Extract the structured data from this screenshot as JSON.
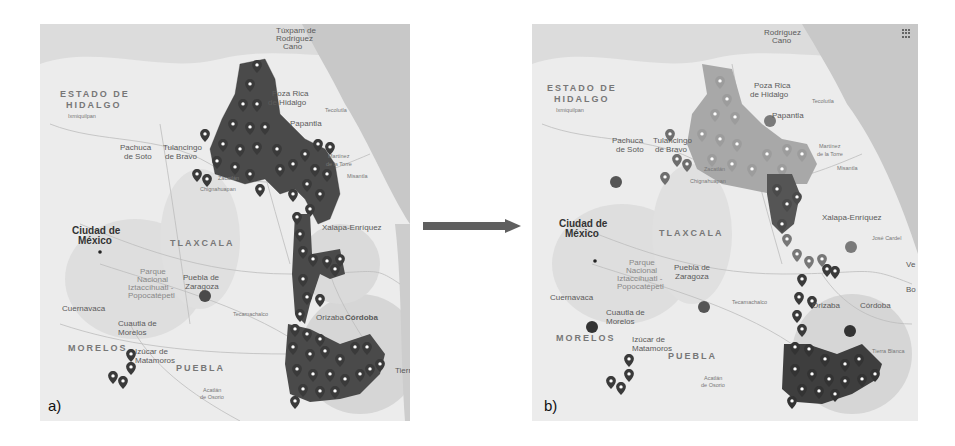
{
  "figure": {
    "panels": [
      {
        "tag": "a)",
        "labels": {
          "state_hidalgo_1": "ESTADO DE",
          "state_hidalgo_2": "HIDALGO",
          "ixmiquilpan": "Ixmiquilpan",
          "tuxpam_1": "Túxpam de",
          "tuxpam_2": "Rodríguez",
          "tuxpam_3": "Cano",
          "poza_rica_1": "Poza Rica",
          "poza_rica_2": "de Hidalgo",
          "tecolutla": "Tecolutla",
          "papantla": "Papantla",
          "martinez_1": "Martínez",
          "martinez_2": "de la Torre",
          "misantla": "Misantla",
          "pachuca_1": "Pachuca",
          "pachuca_2": "de Soto",
          "tulancingo_1": "Tulancingo",
          "tulancingo_2": "de Bravo",
          "zacatlan": "Zacatlán",
          "chignahuapan": "Chignahuapan",
          "xalapa": "Xalapa-Enríquez",
          "coatepec": "Coatepec",
          "cdmx_1": "Ciudad de",
          "cdmx_2": "México",
          "tlaxcala": "TLAXCALA",
          "parque_1": "Parque",
          "parque_2": "Nacional",
          "parque_3": "Iztaccíhuatl -",
          "parque_4": "Popocatépetl",
          "puebla_city_1": "Puebla de",
          "puebla_city_2": "Zaragoza",
          "cuernavaca": "Cuernavaca",
          "cuautla_1": "Cuautla de",
          "cuautla_2": "Morelos",
          "morelos": "MORELOS",
          "izucar_1": "Izúcar de",
          "izucar_2": "Matamoros",
          "puebla_state": "PUEBLA",
          "tecamachalco": "Tecamachalco",
          "orizaba": "Orizaba",
          "cordoba": "Córdoba",
          "acatlan_1": "Acatlán",
          "acatlan_2": "de Osorio",
          "tehuacan": "Te",
          "tierra": "Tierr",
          "jose": "José"
        },
        "road_shields": [
          "180",
          "105",
          "85",
          "130",
          "132",
          "119",
          "131",
          "136",
          "140",
          "150D",
          "115",
          "134",
          "150",
          "129",
          "180",
          "190",
          "125",
          "135"
        ]
      },
      {
        "tag": "b)",
        "labels": {
          "state_hidalgo_1": "ESTADO DE",
          "state_hidalgo_2": "HIDALGO",
          "ixmiquilpan": "Ixmiquilpan",
          "tuxpam_2": "Rodríguez",
          "tuxpam_3": "Cano",
          "poza_rica_1": "Poza Rica",
          "poza_rica_2": "de Hidalgo",
          "tecolutla": "Tecolutla",
          "papantla": "Papantla",
          "martinez_1": "Martínez",
          "martinez_2": "de la Torre",
          "misantla": "Misantla",
          "pachuca_1": "Pachuca",
          "pachuca_2": "de Soto",
          "tulancingo_1": "Tulancingo",
          "tulancingo_2": "de Bravo",
          "zacatlan": "Zacatlán",
          "chignahuapan": "Chignahuapan",
          "xalapa": "Xalapa-Enríquez",
          "coatepec": "Coatepec",
          "cdmx_1": "Ciudad de",
          "cdmx_2": "México",
          "tlaxcala": "TLAXCALA",
          "parque_1": "Parque",
          "parque_2": "Nacional",
          "parque_3": "Iztaccíhuatl -",
          "parque_4": "Popocatépetl",
          "puebla_city_1": "Puebla de",
          "puebla_city_2": "Zaragoza",
          "cuernavaca": "Cuernavaca",
          "cuautla_1": "Cuautla de",
          "cuautla_2": "Morelos",
          "morelos": "MORELOS",
          "izucar_1": "Izúcar de",
          "izucar_2": "Matamoros",
          "puebla_state": "PUEBLA",
          "tecamachalco": "Tecamachalco",
          "orizaba": "Orizaba",
          "cordoba": "Córdoba",
          "acatlan_1": "Acatlán",
          "acatlan_2": "de Osorio",
          "tierra_blanca": "Tierra Blanca",
          "jose_cardel": "José Cardel",
          "ve": "Ve",
          "bo": "Bo"
        },
        "cluster_badges": [
          "Pachuca",
          "Poza Rica",
          "Xalapa",
          "Puebla",
          "Cuernavaca",
          "Córdoba"
        ]
      }
    ],
    "arrow": {
      "direction": "right",
      "color": "#5f5f5f"
    },
    "colors": {
      "marker_dark": "#3a3a3a",
      "marker_mid": "#7a7a7a",
      "marker_light": "#a0a0a0",
      "land": "#ececec",
      "sea": "#c9c9c9",
      "terrain": "#d8d8d8"
    }
  }
}
